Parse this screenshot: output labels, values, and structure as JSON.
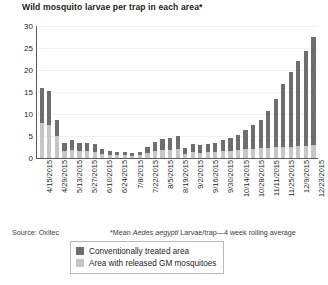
{
  "chart_data": {
    "type": "bar",
    "title": "Wild mosquito larvae per trap in each area*",
    "xlabel": "",
    "ylabel": "",
    "ylim": [
      0,
      30
    ],
    "yticks": [
      0,
      5,
      10,
      15,
      20,
      25,
      30
    ],
    "grid": true,
    "legend_position": "bottom",
    "stacked": true,
    "note": "Each bar is one weekly observation; date labels appear every other bar.",
    "categories": [
      "4/15/2015",
      "4/22/2015",
      "4/29/2015",
      "5/6/2015",
      "5/13/2015",
      "5/20/2015",
      "5/27/2015",
      "6/3/2015",
      "6/10/2015",
      "6/17/2015",
      "6/24/2015",
      "7/1/2015",
      "7/8/2015",
      "7/15/2015",
      "7/22/2015",
      "7/29/2015",
      "8/5/2015",
      "8/12/2015",
      "8/19/2015",
      "8/26/2015",
      "9/2/2015",
      "9/9/2015",
      "9/16/2015",
      "9/23/2015",
      "9/30/2015",
      "10/7/2015",
      "10/14/2015",
      "10/21/2015",
      "10/28/2015",
      "11/4/2015",
      "11/11/2015",
      "11/18/2015",
      "11/25/2015",
      "12/2/2015",
      "12/9/2015",
      "12/16/2015",
      "12/23/2015"
    ],
    "tick_labels": [
      "4/15/2015",
      "4/29/2015",
      "5/13/2015",
      "5/27/2015",
      "6/10/2015",
      "6/24/2015",
      "7/8/2015",
      "7/22/2015",
      "8/5/2015",
      "8/19/2015",
      "9/2/2015",
      "9/16/2015",
      "9/30/2015",
      "10/14/2015",
      "10/28/2015",
      "11/11/2015",
      "11/25/2015",
      "12/9/2015",
      "12/23/2015"
    ],
    "series": [
      {
        "name": "Conventionally treated area",
        "color": "#6e6e6e",
        "values": [
          16.0,
          15.2,
          8.6,
          3.5,
          4.0,
          3.3,
          3.5,
          3.2,
          2.0,
          1.6,
          1.4,
          1.3,
          1.2,
          1.4,
          2.6,
          3.6,
          4.4,
          4.6,
          5.0,
          2.2,
          3.2,
          3.0,
          3.2,
          3.4,
          4.2,
          4.6,
          5.2,
          6.4,
          7.4,
          8.6,
          10.6,
          13.4,
          16.8,
          19.6,
          22.0,
          24.4,
          27.5
        ]
      },
      {
        "name": "Area with released GM mosquitoes",
        "color": "#c6c6c6",
        "values": [
          8.0,
          7.4,
          5.0,
          1.6,
          1.8,
          1.5,
          1.7,
          1.4,
          0.9,
          0.7,
          0.6,
          0.6,
          0.5,
          0.6,
          1.1,
          1.5,
          1.8,
          1.9,
          2.0,
          1.0,
          1.3,
          1.2,
          1.3,
          1.4,
          1.6,
          1.7,
          1.8,
          2.0,
          2.1,
          2.2,
          2.3,
          2.4,
          2.5,
          2.6,
          2.7,
          2.8,
          2.9
        ]
      }
    ]
  },
  "footer": {
    "source": "Source: Oxitec",
    "footnote_prefix": "*Mean ",
    "footnote_italic": "Aedes aegypti",
    "footnote_suffix": " Larvae/trap—4 week rolling average"
  },
  "legend": {
    "items": [
      {
        "label": "Conventionally treated area",
        "color": "#6e6e6e"
      },
      {
        "label": "Area with released GM mosquitoes",
        "color": "#c6c6c6"
      }
    ]
  }
}
